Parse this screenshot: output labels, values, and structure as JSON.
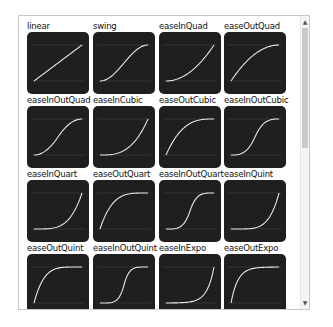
{
  "easings": [
    {
      "name": "linear",
      "fn": "linear"
    },
    {
      "name": "swing",
      "fn": "swing"
    },
    {
      "name": "easeInQuad",
      "fn": "easeInQuad"
    },
    {
      "name": "easeOutQuad",
      "fn": "easeOutQuad"
    },
    {
      "name": "easeInOutQuad",
      "fn": "easeInOutQuad"
    },
    {
      "name": "easeInCubic",
      "fn": "easeInCubic"
    },
    {
      "name": "easeOutCubic",
      "fn": "easeOutCubic"
    },
    {
      "name": "easeInOutCubic",
      "fn": "easeInOutCubic"
    },
    {
      "name": "easeInQuart",
      "fn": "easeInQuart"
    },
    {
      "name": "easeOutQuart",
      "fn": "easeOutQuart"
    },
    {
      "name": "easeInOutQuart",
      "fn": "easeInOutQuart"
    },
    {
      "name": "easeInQuint",
      "fn": "easeInQuint"
    },
    {
      "name": "easeOutQuint",
      "fn": "easeOutQuint"
    },
    {
      "name": "easeInOutQuint",
      "fn": "easeInOutQuint"
    },
    {
      "name": "easeInExpo",
      "fn": "easeInExpo"
    },
    {
      "name": "easeOutExpo",
      "fn": "easeOutExpo"
    }
  ],
  "scrollbar": {
    "up_arrow": "▲",
    "down_arrow": "▼"
  },
  "colors": {
    "tile_bg": "#1f1f1f",
    "curve": "#e8e8e8",
    "guide": "#444444"
  }
}
